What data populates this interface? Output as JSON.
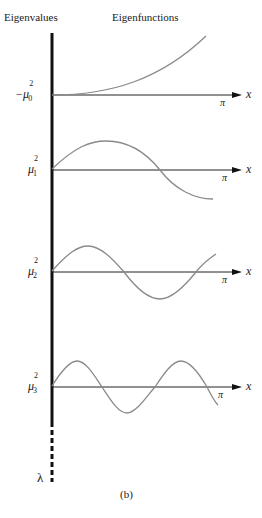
{
  "headers": {
    "left": "Eigenvalues",
    "right": "Eigenfunctions"
  },
  "axis_label_x": "x",
  "pi_label": "π",
  "lambda_label": "λ",
  "caption": "(b)",
  "rows": [
    {
      "label_prefix": "−μ",
      "sub": "0",
      "sup": "2",
      "function": "growing (sinh-like)",
      "y": 95
    },
    {
      "label_prefix": "μ",
      "sub": "1",
      "sup": "2",
      "function": "sin, one hump",
      "y": 170
    },
    {
      "label_prefix": "μ",
      "sub": "2",
      "sup": "2",
      "function": "sin, 1.5 periods",
      "y": 272
    },
    {
      "label_prefix": "μ",
      "sub": "3",
      "sup": "2",
      "function": "sin, 2.5 periods",
      "y": 387
    }
  ],
  "colors": {
    "axis": "#111111",
    "curve": "#8a8a8a"
  }
}
